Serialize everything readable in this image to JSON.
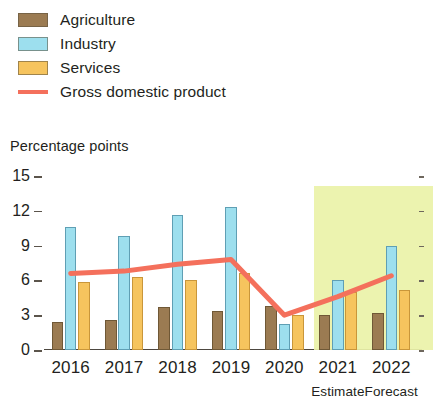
{
  "legend": {
    "items": [
      {
        "label": "Agriculture",
        "color": "#9b7b52",
        "marker": "square-swatch"
      },
      {
        "label": "Industry",
        "color": "#9ddfee",
        "marker": "square-swatch"
      },
      {
        "label": "Services",
        "color": "#f6c45e",
        "marker": "square-swatch"
      },
      {
        "label": "Gross domestic product",
        "color": "#f4705c",
        "marker": "line-swatch"
      }
    ]
  },
  "axis_title": "Percentage points",
  "notes": {
    "estimate": "Estimate",
    "forecast": "Forecast"
  },
  "chart_data": {
    "type": "bar",
    "title": "",
    "subtitle": "",
    "xlabel": "",
    "ylabel": "Percentage points",
    "ylim": [
      0,
      15
    ],
    "yticks": [
      0,
      3,
      6,
      9,
      12,
      15
    ],
    "ytick_labels": [
      "0",
      "3",
      "6",
      "9",
      "12",
      "15"
    ],
    "grid": false,
    "legend_position": "top-left",
    "categories": [
      "2016",
      "2017",
      "2018",
      "2019",
      "2020",
      "2021",
      "2022"
    ],
    "series": [
      {
        "name": "Agriculture",
        "type": "bar",
        "color": "#9b7b52",
        "values": [
          2.4,
          2.6,
          3.7,
          3.4,
          3.8,
          3.0,
          3.2
        ]
      },
      {
        "name": "Industry",
        "type": "bar",
        "color": "#9ddfee",
        "values": [
          10.6,
          9.8,
          11.6,
          12.3,
          2.2,
          6.0,
          9.0
        ]
      },
      {
        "name": "Services",
        "type": "bar",
        "color": "#f6c45e",
        "values": [
          5.9,
          6.3,
          6.0,
          6.6,
          3.0,
          5.0,
          5.2
        ]
      },
      {
        "name": "Gross domestic product",
        "type": "line",
        "color": "#f4705c",
        "values": [
          6.6,
          6.8,
          7.4,
          7.8,
          3.0,
          4.6,
          6.4
        ]
      }
    ],
    "annotations": [
      {
        "text": "Estimate",
        "category": "2021"
      },
      {
        "text": "Forecast",
        "category": "2022"
      }
    ],
    "highlight_band": {
      "from": "2021",
      "to": "2022",
      "color": "#eaf2a8"
    }
  }
}
